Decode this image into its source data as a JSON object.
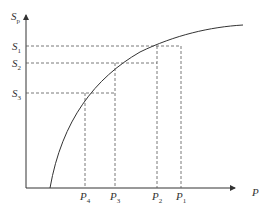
{
  "diagram": {
    "type": "concave-curve-with-projections",
    "axes": {
      "y_label": {
        "main": "S",
        "sub": "p"
      },
      "x_label": {
        "main": "P",
        "sub": ""
      }
    },
    "y_levels": [
      {
        "main": "S",
        "sub": "1",
        "y": 46
      },
      {
        "main": "S",
        "sub": "2",
        "y": 63
      },
      {
        "main": "S",
        "sub": "3",
        "y": 93
      }
    ],
    "x_levels": [
      {
        "main": "P",
        "sub": "4",
        "x": 85
      },
      {
        "main": "P",
        "sub": "3",
        "x": 115
      },
      {
        "main": "P",
        "sub": "2",
        "x": 157
      },
      {
        "main": "P",
        "sub": "1",
        "x": 181
      }
    ],
    "colors": {
      "axis": "#333333",
      "curve": "#333333",
      "dashed": "#555555",
      "background": "#ffffff"
    }
  }
}
